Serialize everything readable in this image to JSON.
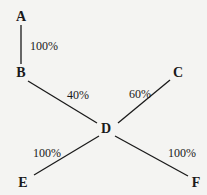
{
  "diagram": {
    "nodes": [
      {
        "id": "A",
        "label": "A",
        "x": 21,
        "y": 17
      },
      {
        "id": "B",
        "label": "B",
        "x": 21,
        "y": 73
      },
      {
        "id": "C",
        "label": "C",
        "x": 178,
        "y": 73
      },
      {
        "id": "D",
        "label": "D",
        "x": 106,
        "y": 129
      },
      {
        "id": "E",
        "label": "E",
        "x": 23,
        "y": 183
      },
      {
        "id": "F",
        "label": "F",
        "x": 196,
        "y": 183
      }
    ],
    "edges": [
      {
        "from": "A",
        "to": "B",
        "label": "100%"
      },
      {
        "from": "B",
        "to": "D",
        "label": "40%"
      },
      {
        "from": "C",
        "to": "D",
        "label": "60%"
      },
      {
        "from": "D",
        "to": "E",
        "label": "100%"
      },
      {
        "from": "D",
        "to": "F",
        "label": "100%"
      }
    ],
    "colors": {
      "line": "#1a1a1a",
      "background": "#f4f4f2"
    }
  }
}
